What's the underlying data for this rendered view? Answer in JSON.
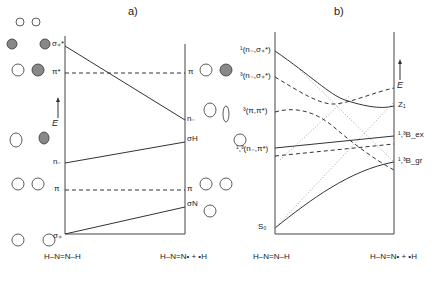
{
  "panel_a": {
    "title": "a)",
    "energy_axis": "E",
    "left_levels": [
      {
        "label": "σ₊*",
        "y": 46,
        "style": "solid"
      },
      {
        "label": "π*",
        "y": 73,
        "style": "dashed"
      },
      {
        "label": "n₋",
        "y": 163,
        "style": "solid"
      },
      {
        "label": "π",
        "y": 190,
        "style": "dashed"
      },
      {
        "label": "σ₊",
        "y": 238,
        "style": "solid"
      }
    ],
    "right_levels": [
      {
        "label": "π",
        "y": 73
      },
      {
        "label": "n₋",
        "y": 120
      },
      {
        "label": "σH",
        "y": 142
      },
      {
        "label": "π",
        "y": 190
      },
      {
        "label": "σN",
        "y": 207
      }
    ],
    "bottom_left": "H–N=N–H",
    "bottom_right": "H–N=N• + •H",
    "left_molecule_labels": [
      "N",
      "N",
      "H",
      "H"
    ],
    "right_molecule_labels": [
      "N",
      "N",
      "H",
      "H"
    ]
  },
  "panel_b": {
    "title": "b)",
    "energy_axis": "E",
    "left_states": [
      {
        "label": "¹(n₋,σ₊*)",
        "y": 51
      },
      {
        "label": "³(n₋,σ₊*)",
        "y": 77
      },
      {
        "label": "³(π,π*)",
        "y": 112
      },
      {
        "label": "¹,³(n₋,π*)",
        "y": 150
      },
      {
        "label": "S₀",
        "y": 228
      }
    ],
    "right_states": [
      {
        "label": "Z₁",
        "y": 106
      },
      {
        "label": "¹,³B_ex",
        "y": 136
      },
      {
        "label": "¹,³B_gr",
        "y": 162
      }
    ],
    "bottom_left": "H–N=N–H",
    "bottom_right": "H–N=N• + •H"
  }
}
